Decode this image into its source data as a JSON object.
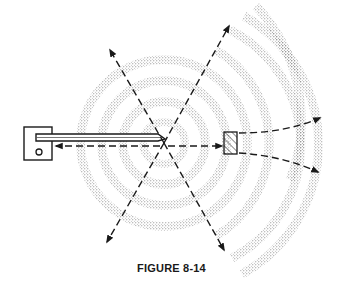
{
  "figure": {
    "caption": "FIGURE 8-14"
  },
  "colors": {
    "ink": "#1a1a1a",
    "stipple": "#6f6f6f",
    "background": "#ffffff"
  },
  "elements": {
    "source_housing": "wave-generator-housing",
    "rod": "vibrating-rod",
    "source_point": "wave-source-point",
    "waves": "concentric-stippled-wavefronts",
    "obstacle": "hatched-obstacle",
    "arrows": "dashed-propagation-arrows"
  }
}
